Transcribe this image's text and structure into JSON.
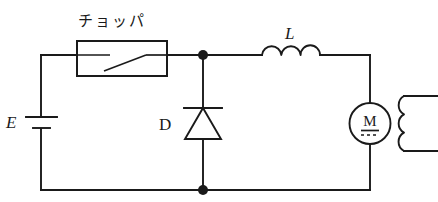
{
  "diagram": {
    "title": "チョッパ",
    "type": "schematic",
    "background_color": "#ffffff",
    "line_color": "#1a1a1a",
    "labels": {
      "chopper": "チョッパ",
      "source": "E",
      "diode": "D",
      "inductor": "L",
      "motor": "M"
    },
    "components": [
      {
        "name": "dc-source",
        "label": "E",
        "symbol": "battery",
        "position": "left-rail"
      },
      {
        "name": "chopper-switch",
        "label": "チョッパ",
        "symbol": "switch-in-box",
        "position": "top-left"
      },
      {
        "name": "freewheel-diode",
        "label": "D",
        "symbol": "diode",
        "orientation": "cathode-up",
        "position": "middle-branch"
      },
      {
        "name": "smoothing-inductor",
        "label": "L",
        "symbol": "inductor-3-turn",
        "position": "top-right"
      },
      {
        "name": "dc-motor",
        "label": "M",
        "symbol": "motor-circle",
        "position": "right-rail"
      },
      {
        "name": "field-winding",
        "label": "",
        "symbol": "coil-3-turn",
        "position": "far-right"
      }
    ],
    "nodes": [
      {
        "name": "top-junction",
        "x": 203,
        "y": 55
      },
      {
        "name": "bottom-junction",
        "x": 203,
        "y": 190
      }
    ]
  }
}
